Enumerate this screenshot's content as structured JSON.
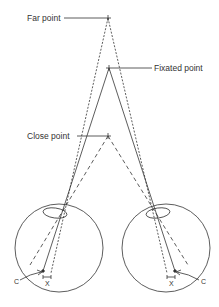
{
  "diagram": {
    "labels": {
      "far_point": "Far point",
      "fixated_point": "Fixated point",
      "close_point": "Close point",
      "left_c": "C",
      "left_x": "X",
      "right_c": "C",
      "right_x": "X"
    },
    "colors": {
      "line": "#333333",
      "background": "#ffffff"
    },
    "points": {
      "far_point": [
        108,
        18
      ],
      "fixated_point": [
        109,
        68
      ],
      "close_point": [
        108,
        136
      ]
    },
    "eyes": [
      {
        "side": "left",
        "center": [
          59,
          248
        ],
        "radius": 44
      },
      {
        "side": "right",
        "center": [
          166,
          248
        ],
        "radius": 44
      }
    ]
  }
}
